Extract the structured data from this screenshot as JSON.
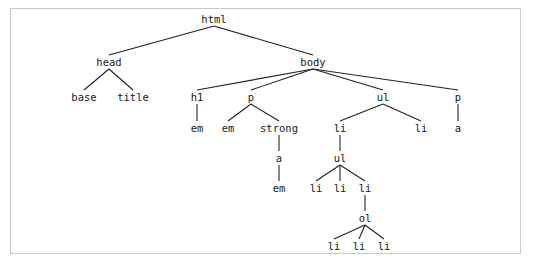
{
  "figure": {
    "type": "tree-diagram",
    "background_color": "#ffffff",
    "frame_color": "#c9c9c9",
    "text_color": "#1a1a1a",
    "edge_color": "#222222"
  },
  "tree": {
    "nodes": [
      {
        "id": "html",
        "label": "html",
        "x": 214,
        "y": 19
      },
      {
        "id": "head",
        "label": "head",
        "x": 109,
        "y": 62
      },
      {
        "id": "body",
        "label": "body",
        "x": 313,
        "y": 62
      },
      {
        "id": "base",
        "label": "base",
        "x": 84,
        "y": 97
      },
      {
        "id": "title",
        "label": "title",
        "x": 133,
        "y": 97
      },
      {
        "id": "h1",
        "label": "h1",
        "x": 197,
        "y": 97
      },
      {
        "id": "p1",
        "label": "p",
        "x": 251,
        "y": 97
      },
      {
        "id": "ul1",
        "label": "ul",
        "x": 383,
        "y": 97
      },
      {
        "id": "p2",
        "label": "p",
        "x": 458,
        "y": 97
      },
      {
        "id": "em1",
        "label": "em",
        "x": 197,
        "y": 128
      },
      {
        "id": "em2",
        "label": "em",
        "x": 228,
        "y": 128
      },
      {
        "id": "strong",
        "label": "strong",
        "x": 279,
        "y": 128
      },
      {
        "id": "li1",
        "label": "li",
        "x": 340,
        "y": 128
      },
      {
        "id": "li2",
        "label": "li",
        "x": 421,
        "y": 128
      },
      {
        "id": "a1",
        "label": "a",
        "x": 458,
        "y": 128
      },
      {
        "id": "a2",
        "label": "a",
        "x": 279,
        "y": 158
      },
      {
        "id": "ul2",
        "label": "ul",
        "x": 340,
        "y": 158
      },
      {
        "id": "em3",
        "label": "em",
        "x": 279,
        "y": 188
      },
      {
        "id": "li3",
        "label": "li",
        "x": 316,
        "y": 188
      },
      {
        "id": "li4",
        "label": "li",
        "x": 340,
        "y": 188
      },
      {
        "id": "li5",
        "label": "li",
        "x": 365,
        "y": 188
      },
      {
        "id": "ol",
        "label": "ol",
        "x": 365,
        "y": 218
      },
      {
        "id": "li6",
        "label": "li",
        "x": 334,
        "y": 246
      },
      {
        "id": "li7",
        "label": "li",
        "x": 359,
        "y": 246
      },
      {
        "id": "li8",
        "label": "li",
        "x": 384,
        "y": 246
      }
    ],
    "edges": [
      [
        "html",
        "head"
      ],
      [
        "html",
        "body"
      ],
      [
        "head",
        "base"
      ],
      [
        "head",
        "title"
      ],
      [
        "body",
        "h1"
      ],
      [
        "body",
        "p1"
      ],
      [
        "body",
        "ul1"
      ],
      [
        "body",
        "p2"
      ],
      [
        "h1",
        "em1"
      ],
      [
        "p1",
        "em2"
      ],
      [
        "p1",
        "strong"
      ],
      [
        "ul1",
        "li1"
      ],
      [
        "ul1",
        "li2"
      ],
      [
        "p2",
        "a1"
      ],
      [
        "strong",
        "a2"
      ],
      [
        "li1",
        "ul2"
      ],
      [
        "a2",
        "em3"
      ],
      [
        "ul2",
        "li3"
      ],
      [
        "ul2",
        "li4"
      ],
      [
        "ul2",
        "li5"
      ],
      [
        "li5",
        "ol"
      ],
      [
        "ol",
        "li6"
      ],
      [
        "ol",
        "li7"
      ],
      [
        "ol",
        "li8"
      ]
    ]
  }
}
